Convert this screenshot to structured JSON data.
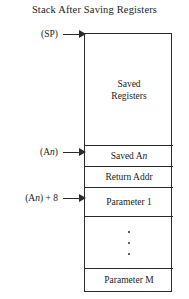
{
  "figure": {
    "title": "Stack After Saving Registers",
    "colors": {
      "line": "#2b2b2b",
      "text": "#1c1c1c",
      "background": "#ffffff"
    }
  },
  "stack": {
    "cells": [
      {
        "id": "saved-registers",
        "line1": "Saved",
        "line2": "Registers"
      },
      {
        "id": "saved-an",
        "label_pre": "Saved A",
        "label_italic": "n"
      },
      {
        "id": "return-addr",
        "label": "Return Addr"
      },
      {
        "id": "parameter-1",
        "label": "Parameter 1"
      },
      {
        "id": "ellipsis",
        "label": ""
      },
      {
        "id": "parameter-m",
        "label": "Parameter M"
      }
    ]
  },
  "pointers": [
    {
      "id": "sp",
      "pre": "(SP)",
      "italic": "",
      "post": "",
      "target": "saved-registers-top"
    },
    {
      "id": "an",
      "pre": "(A",
      "italic": "n",
      "post": ")",
      "target": "saved-an"
    },
    {
      "id": "an-8",
      "pre": "(A",
      "italic": "n",
      "post": ") + 8",
      "target": "parameter-1"
    }
  ],
  "pointer_labels": {
    "sp": "(SP)",
    "an": "(An)",
    "an_8": "(An) + 8"
  }
}
